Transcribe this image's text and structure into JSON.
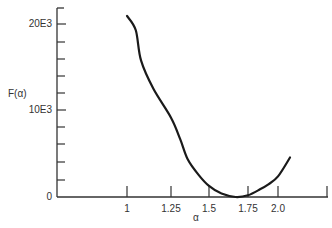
{
  "chart_data": {
    "type": "line",
    "title": "",
    "xlabel": "α",
    "ylabel": "F(α)",
    "x_ticks": [
      {
        "label": "1",
        "value": 1.0,
        "px": 127
      },
      {
        "label": "1.25",
        "value": 1.25,
        "px": 171
      },
      {
        "label": "1.5",
        "value": 1.5,
        "px": 209
      },
      {
        "label": "1.75",
        "value": 1.75,
        "px": 248
      },
      {
        "label": "2.0",
        "value": 2.0,
        "px": 278
      },
      {
        "label": "",
        "value": null,
        "px": 327
      }
    ],
    "y_ticks": [
      {
        "label": "0",
        "value": 0,
        "px": 197
      },
      {
        "label": "",
        "value": 2000,
        "px": 180
      },
      {
        "label": "",
        "value": 4000,
        "px": 162
      },
      {
        "label": "",
        "value": 6000,
        "px": 144
      },
      {
        "label": "",
        "value": 8000,
        "px": 127
      },
      {
        "label": "10E3",
        "value": 10000,
        "px": 110
      },
      {
        "label": "",
        "value": 12000,
        "px": 93
      },
      {
        "label": "",
        "value": 14000,
        "px": 76
      },
      {
        "label": "",
        "value": 16000,
        "px": 59
      },
      {
        "label": "",
        "value": 18000,
        "px": 42
      },
      {
        "label": "20E3",
        "value": 20000,
        "px": 24
      }
    ],
    "ylim": [
      0,
      22000
    ],
    "xlim": [
      0.6,
      2.3
    ],
    "grid": false,
    "legend": null,
    "series": [
      {
        "name": "F(α)",
        "x": [
          1.0,
          1.05,
          1.08,
          1.15,
          1.25,
          1.31,
          1.36,
          1.43,
          1.5,
          1.58,
          1.67,
          1.75,
          1.85,
          1.92,
          2.0,
          2.1
        ],
        "values": [
          20900,
          19300,
          15800,
          12500,
          9100,
          6600,
          4300,
          2600,
          1300,
          400,
          0,
          200,
          900,
          1500,
          2400,
          4500
        ]
      }
    ]
  },
  "axes": {
    "y_label": "F(α)",
    "x_label": "α"
  }
}
